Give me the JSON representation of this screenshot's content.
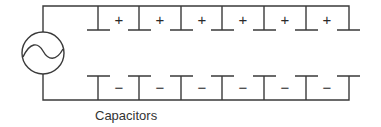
{
  "diagram": {
    "type": "circuit",
    "source": {
      "kind": "ac-voltage-source",
      "symbol": "sine-wave-in-circle"
    },
    "capacitors": [
      {
        "index": 1,
        "top_sign": "+",
        "bottom_sign": "−"
      },
      {
        "index": 2,
        "top_sign": "+",
        "bottom_sign": "−"
      },
      {
        "index": 3,
        "top_sign": "+",
        "bottom_sign": "−"
      },
      {
        "index": 4,
        "top_sign": "+",
        "bottom_sign": "−"
      },
      {
        "index": 5,
        "top_sign": "+",
        "bottom_sign": "−"
      },
      {
        "index": 6,
        "top_sign": "+",
        "bottom_sign": "−"
      }
    ],
    "label": "Capacitors",
    "colors": {
      "line": "#3a3a3a",
      "text": "#333333",
      "background": "#ffffff"
    }
  }
}
